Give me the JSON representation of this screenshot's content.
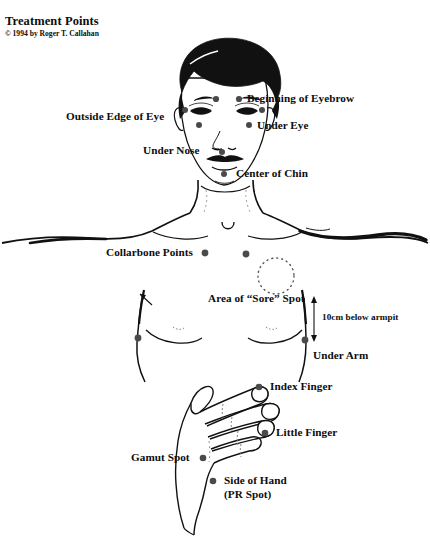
{
  "document": {
    "title": "Treatment Points",
    "copyright": "© 1994 by Roger T. Callahan",
    "background_color": "#ffffff",
    "ink_color": "#0d0d0d",
    "point_color": "#4a4a4a"
  },
  "labels": {
    "beginning_of_eyebrow": "Beginning of Eyebrow",
    "outside_edge_of_eye": "Outside Edge of Eye",
    "under_eye": "Under Eye",
    "under_nose": "Under Nose",
    "center_of_chin": "Center of Chin",
    "collarbone_points": "Collarbone Points",
    "area_of_sore_spot": "Area of “Sore” Spot",
    "ten_cm_below_armpit": "10cm below armpit",
    "under_arm": "Under Arm",
    "index_finger": "Index Finger",
    "little_finger": "Little Finger",
    "gamut_spot": "Gamut Spot",
    "side_of_hand": "Side of Hand",
    "pr_spot": "(PR Spot)"
  },
  "points": [
    {
      "name": "beginning-of-eyebrow-left",
      "x": 216,
      "y": 99,
      "r": 3.1
    },
    {
      "name": "beginning-of-eyebrow-right",
      "x": 239,
      "y": 99,
      "r": 3.1
    },
    {
      "name": "outside-edge-of-eye-left",
      "x": 185,
      "y": 110,
      "r": 3.0
    },
    {
      "name": "outside-edge-of-eye-right",
      "x": 262,
      "y": 110,
      "r": 3.0
    },
    {
      "name": "under-eye-left",
      "x": 199,
      "y": 125,
      "r": 3.0
    },
    {
      "name": "under-eye-right",
      "x": 249,
      "y": 125,
      "r": 3.0
    },
    {
      "name": "under-nose",
      "x": 222,
      "y": 152,
      "r": 3.0
    },
    {
      "name": "center-of-chin",
      "x": 224,
      "y": 174,
      "r": 3.0
    },
    {
      "name": "collarbone-point-left",
      "x": 205,
      "y": 253,
      "r": 3.4
    },
    {
      "name": "collarbone-point-right",
      "x": 246,
      "y": 254,
      "r": 3.4
    },
    {
      "name": "under-arm-left",
      "x": 138,
      "y": 338,
      "r": 3.4
    },
    {
      "name": "under-arm-right",
      "x": 305,
      "y": 340,
      "r": 3.4
    },
    {
      "name": "index-finger",
      "x": 259,
      "y": 387,
      "r": 3.3
    },
    {
      "name": "little-finger",
      "x": 265,
      "y": 433,
      "r": 3.3
    },
    {
      "name": "gamut-spot",
      "x": 203,
      "y": 458,
      "r": 3.3
    },
    {
      "name": "side-of-hand-pr-spot",
      "x": 213,
      "y": 481,
      "r": 3.3
    }
  ],
  "sore_spot_circle": {
    "cx": 276,
    "cy": 276,
    "r": 18,
    "style": "dotted"
  }
}
